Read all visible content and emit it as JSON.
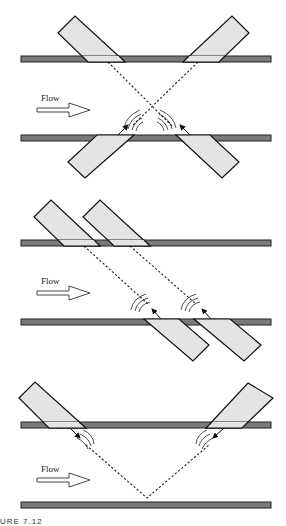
{
  "diagram": {
    "panels": [
      {
        "id": "cross-path",
        "flow_label": "Flow",
        "transducer_count": 4
      },
      {
        "id": "parallel-path",
        "flow_label": "Flow",
        "transducer_count": 4
      },
      {
        "id": "reflect-v-path",
        "flow_label": "Flow",
        "transducer_count": 2
      }
    ],
    "caption": "URE 7.12"
  },
  "colors": {
    "pipe_wall": "#7a7a7a",
    "transducer": "#e4e4e4",
    "outline": "#111111",
    "background": "#ffffff"
  }
}
